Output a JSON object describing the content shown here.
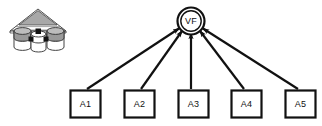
{
  "diagram": {
    "type": "path-diagram",
    "background_color": "#ffffff",
    "stroke_color": "#111111",
    "fill_color": "#ffffff",
    "factor": {
      "label": "VF",
      "shape": "double-circle",
      "cx": 191,
      "cy": 21,
      "outer_r": 14,
      "inner_r": 11
    },
    "indicators": [
      {
        "label": "A1",
        "x": 70,
        "y": 90,
        "w": 31,
        "h": 28
      },
      {
        "label": "A2",
        "x": 124,
        "y": 90,
        "w": 31,
        "h": 28
      },
      {
        "label": "A3",
        "x": 178,
        "y": 90,
        "w": 31,
        "h": 28
      },
      {
        "label": "A4",
        "x": 231,
        "y": 90,
        "w": 31,
        "h": 28
      },
      {
        "label": "A5",
        "x": 285,
        "y": 90,
        "w": 31,
        "h": 28
      }
    ],
    "arrows": [
      {
        "from": "A1",
        "to": "VF",
        "direction": "up-right"
      },
      {
        "from": "A2",
        "to": "VF",
        "direction": "up-right"
      },
      {
        "from": "A3",
        "to": "VF",
        "direction": "up"
      },
      {
        "from": "A4",
        "to": "VF",
        "direction": "up-left"
      },
      {
        "from": "A5",
        "to": "VF",
        "direction": "up-left"
      }
    ],
    "icon": {
      "name": "data-warehouse-icon",
      "description": "pavilion roof over three database cylinders",
      "roof_fill": "#a8a8a8",
      "cylinder_fill": "#9a9a9a",
      "cylinder_body_fill": "#ffffff",
      "x": 8,
      "y": 8,
      "w": 60,
      "h": 44
    }
  }
}
